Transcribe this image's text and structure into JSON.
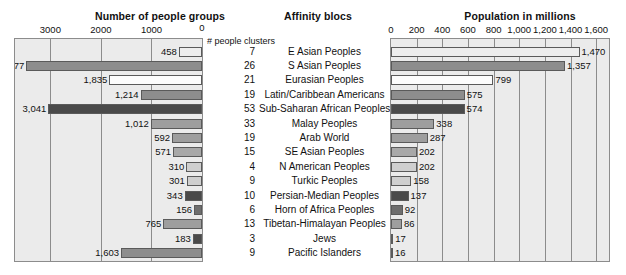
{
  "titles": {
    "left": "Number of people groups",
    "middle": "Affinity blocs",
    "right": "Population in millions"
  },
  "middle_column_header": "# people clusters",
  "axes": {
    "left_ticks": [
      "3000",
      "2000",
      "1000",
      "0"
    ],
    "right_ticks": [
      "0",
      "200",
      "400",
      "600",
      "800",
      "1,000",
      "1,200",
      "1,400",
      "1,600"
    ]
  },
  "chart_data": {
    "type": "bar",
    "title": "Affinity blocs",
    "orientation": "horizontal",
    "layout": "paired back-to-back bar chart with central category table",
    "grid": true,
    "legend": "none",
    "categories": [
      "E Asian Peoples",
      "S Asian Peoples",
      "Eurasian Peoples",
      "Latin/Caribbean Americans",
      "Sub-Saharan African Peoples",
      "Malay Peoples",
      "Arab World",
      "SE Asian Peoples",
      "N American Peoples",
      "Turkic Peoples",
      "Persian-Median Peoples",
      "Horn of Africa Peoples",
      "Tibetan-Himalayan Peoples",
      "Jews",
      "Pacific Islanders"
    ],
    "series": [
      {
        "name": "Number of people groups",
        "axis": "left",
        "direction": "right-to-left",
        "xlabel": "Number of people groups",
        "xlim": [
          0,
          3700
        ],
        "ticks": [
          3000,
          2000,
          1000,
          0
        ],
        "values": [
          458,
          3477,
          1835,
          1214,
          3041,
          1012,
          592,
          571,
          310,
          301,
          343,
          156,
          765,
          183,
          1603
        ],
        "labels": [
          "458",
          "3,477",
          "1,835",
          "1,214",
          "3,041",
          "1,012",
          "592",
          "571",
          "310",
          "301",
          "343",
          "156",
          "765",
          "183",
          "1,603"
        ]
      },
      {
        "name": "# people clusters",
        "axis": "middle",
        "values": [
          7,
          26,
          21,
          19,
          53,
          33,
          19,
          15,
          4,
          9,
          10,
          6,
          13,
          3,
          9
        ],
        "labels": [
          "7",
          "26",
          "21",
          "19",
          "53",
          "33",
          "19",
          "15",
          "4",
          "9",
          "10",
          "6",
          "13",
          "3",
          "9"
        ]
      },
      {
        "name": "Population in millions",
        "axis": "right",
        "direction": "left-to-right",
        "xlabel": "Population in millions",
        "xlim": [
          0,
          1700
        ],
        "ticks": [
          0,
          200,
          400,
          600,
          800,
          1000,
          1200,
          1400,
          1600
        ],
        "values": [
          1470,
          1357,
          799,
          575,
          574,
          338,
          287,
          202,
          202,
          158,
          137,
          92,
          86,
          17,
          16
        ],
        "labels": [
          "1,470",
          "1,357",
          "799",
          "575",
          "574",
          "338",
          "287",
          "202",
          "202",
          "158",
          "137",
          "92",
          "86",
          "17",
          "16"
        ]
      }
    ],
    "bar_shades": [
      "#ededed",
      "#8d8d8d",
      "#fcfcfc",
      "#8d8d8d",
      "#4a4a4a",
      "#9e9e9e",
      "#9e9e9e",
      "#a8a8a8",
      "#cfcfcf",
      "#cfcfcf",
      "#4a4a4a",
      "#6e6e6e",
      "#9e9e9e",
      "#4a4a4a",
      "#8d8d8d"
    ]
  },
  "colors": {
    "plot_background": "#ebebeb",
    "gridline": "#8c8c8c",
    "bar_border": "#5a5a5a",
    "text": "#111111"
  }
}
